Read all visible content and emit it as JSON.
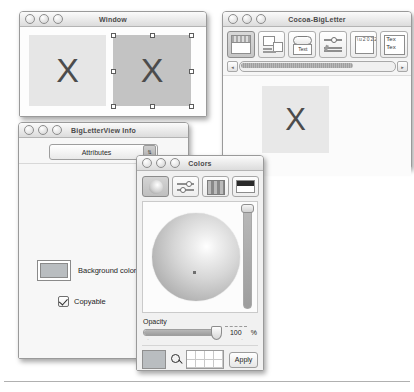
{
  "windows": {
    "main": {
      "title": "Window",
      "letter_left": "X",
      "letter_right": "X"
    },
    "cocoa": {
      "title": "Cocoa-BigLetter",
      "letter": "X",
      "palette_items": [
        {
          "name": "window-palette-icon",
          "label": ""
        },
        {
          "name": "views-palette-icon",
          "label": ""
        },
        {
          "name": "controls-palette-icon",
          "label": "Text"
        },
        {
          "name": "sliders-palette-icon",
          "label": ""
        },
        {
          "name": "containers-palette-icon",
          "label": ""
        },
        {
          "name": "text-palette-icon",
          "label": "Text"
        }
      ],
      "text_icon_line1": "Tex",
      "text_icon_line2": "Tex",
      "scroll_left_arrow": "◂",
      "scroll_right_arrow": "▸"
    },
    "info": {
      "title": "BigLetterView Info",
      "popup_value": "Attributes",
      "popup_arrow": "⇅",
      "background_color_label": "Background color",
      "background_color_value": "#b9bdc0",
      "copyable_label": "Copyable",
      "copyable_checked": true
    },
    "colors": {
      "title": "Colors",
      "toolbar": [
        {
          "name": "color-wheel-tab",
          "selected": true
        },
        {
          "name": "color-sliders-tab",
          "selected": false
        },
        {
          "name": "color-palettes-tab",
          "selected": false
        },
        {
          "name": "image-palettes-tab",
          "selected": false
        }
      ],
      "opacity_label": "Opacity",
      "opacity_value": "100",
      "opacity_unit": "%",
      "apply_label": "Apply",
      "swatch_value": "#b9bdc0",
      "tick_left": "·",
      "tick_mid": "·"
    }
  },
  "traffic_lights": {
    "close": "close-button",
    "minimize": "minimize-button",
    "zoom": "zoom-button"
  }
}
